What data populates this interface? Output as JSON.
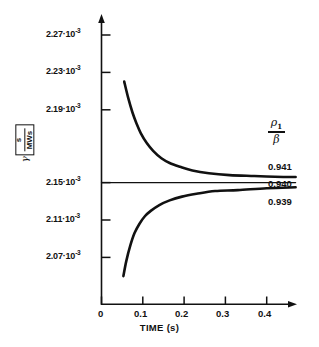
{
  "chart_data": {
    "type": "line",
    "title": "",
    "xlabel": "TIME (s)",
    "ylabel": "γ [ s / MWs ]",
    "ylabel_parts": {
      "symbol": "γ",
      "unit_numerator": "s",
      "unit_denominator": "MWs"
    },
    "xlim": [
      0,
      0.47
    ],
    "ylim": [
      2.05,
      2.29
    ],
    "xticks": [
      0,
      0.1,
      0.2,
      0.3,
      0.4
    ],
    "xtick_labels": [
      "0",
      "0.1",
      "0.2",
      "0.3",
      "0.4"
    ],
    "yticks": [
      0.00227,
      0.00223,
      0.00219,
      0.00215,
      0.00211,
      0.00207
    ],
    "ytick_labels": [
      {
        "mantissa": "2.27·10",
        "exponent": "-3"
      },
      {
        "mantissa": "2.23·10",
        "exponent": "-3"
      },
      {
        "mantissa": "2.19·10",
        "exponent": "-3"
      },
      {
        "mantissa": "2.15·10",
        "exponent": "-3"
      },
      {
        "mantissa": "2.11·10",
        "exponent": "-3"
      },
      {
        "mantissa": "2.07·10",
        "exponent": "-3"
      }
    ],
    "grid": false,
    "legend_position": "right",
    "legend_title": "ρ₁ / β",
    "legend_title_parts": {
      "numerator": "ρ",
      "numerator_sub": "1",
      "denominator": "β"
    },
    "series": [
      {
        "name": "0.941",
        "label": "0.941",
        "color": "#111111",
        "points": [
          [
            0.055,
            0.002258
          ],
          [
            0.065,
            0.00224
          ],
          [
            0.075,
            0.002225
          ],
          [
            0.085,
            0.002213
          ],
          [
            0.095,
            0.002203
          ],
          [
            0.11,
            0.002192
          ],
          [
            0.125,
            0.002184
          ],
          [
            0.145,
            0.002176
          ],
          [
            0.165,
            0.002171
          ],
          [
            0.19,
            0.002167
          ],
          [
            0.22,
            0.002163
          ],
          [
            0.26,
            0.00216
          ],
          [
            0.31,
            0.002158
          ],
          [
            0.37,
            0.002157
          ],
          [
            0.44,
            0.002156
          ],
          [
            0.47,
            0.002156
          ]
        ]
      },
      {
        "name": "0.940",
        "label": "0.940",
        "color": "#111111",
        "points": [
          [
            0.0,
            0.00215
          ],
          [
            0.47,
            0.00215
          ]
        ]
      },
      {
        "name": "0.939",
        "label": "0.939",
        "color": "#111111",
        "points": [
          [
            0.053,
            0.00205
          ],
          [
            0.06,
            0.002066
          ],
          [
            0.07,
            0.002083
          ],
          [
            0.08,
            0.002096
          ],
          [
            0.092,
            0.002106
          ],
          [
            0.105,
            0.002114
          ],
          [
            0.12,
            0.00212
          ],
          [
            0.14,
            0.002126
          ],
          [
            0.165,
            0.002131
          ],
          [
            0.195,
            0.002135
          ],
          [
            0.23,
            0.002138
          ],
          [
            0.275,
            0.002141
          ],
          [
            0.33,
            0.002142
          ],
          [
            0.4,
            0.002144
          ],
          [
            0.47,
            0.002145
          ]
        ]
      }
    ]
  },
  "axes": {
    "y_arrow": true,
    "x_arrow": true,
    "axis_color": "#111111"
  }
}
